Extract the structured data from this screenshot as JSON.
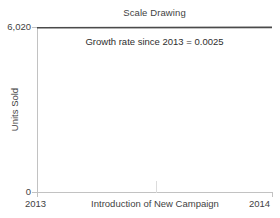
{
  "chart_data": {
    "type": "line",
    "title": "Scale Drawing",
    "xlabel": "",
    "ylabel": "Units Sold",
    "ylim": [
      0,
      6020
    ],
    "xlim": [
      "2013",
      "2014"
    ],
    "grid": false,
    "legend": null,
    "y_ticks": [
      "0",
      "6,020"
    ],
    "x_ticks": [
      "2013",
      "2014"
    ],
    "x": [
      "2013",
      "2014"
    ],
    "series": [
      {
        "name": "Units Sold",
        "values": [
          5990,
          6005
        ],
        "color": "#4a4a4a"
      }
    ],
    "annotations": [
      {
        "name": "growth-rate-note",
        "text": "Growth rate since 2013 = 0.0025"
      },
      {
        "name": "campaign-marker",
        "text": "Introduction of New Campaign"
      }
    ]
  },
  "axes": {
    "y_top_label": "6,020",
    "y_zero_label": "0",
    "y_title": "Units Sold",
    "x_left_label": "2013",
    "x_right_label": "2014",
    "x_mid_label": "Introduction of New Campaign"
  },
  "title": "Scale Drawing",
  "annotation": {
    "growth_rate": "Growth rate since 2013 = 0.0025"
  },
  "colors": {
    "series_line": "#4a4a4a",
    "axis": "#c2c2c2",
    "text": "#3f3f3f"
  }
}
